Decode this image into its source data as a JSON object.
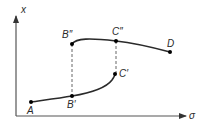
{
  "axes": {
    "y_label": "x",
    "x_label": "σ"
  },
  "points": [
    {
      "id": "A",
      "label": "A"
    },
    {
      "id": "B1",
      "label": "B′"
    },
    {
      "id": "C1",
      "label": "C′"
    },
    {
      "id": "B2",
      "label": "B″"
    },
    {
      "id": "C2",
      "label": "C″"
    },
    {
      "id": "D",
      "label": "D"
    }
  ],
  "colors": {
    "curve": "#2a2a2a",
    "axis": "#555555",
    "dashed": "#666666"
  }
}
